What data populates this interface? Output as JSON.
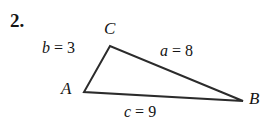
{
  "problem": {
    "number": "2."
  },
  "figure": {
    "type": "triangle-diagram",
    "background_color": "#ffffff",
    "stroke_color": "#2b2b2b",
    "stroke_width": 2,
    "vertices": [
      {
        "name": "C",
        "label": "C",
        "x": 110,
        "y": 46
      },
      {
        "name": "A",
        "label": "A",
        "x": 84,
        "y": 92
      },
      {
        "name": "B",
        "label": "B",
        "x": 243,
        "y": 101
      }
    ],
    "sides": [
      {
        "name": "b",
        "label": "b = 3",
        "var": "b",
        "eq": " = ",
        "value": "3",
        "between": [
          "A",
          "C"
        ]
      },
      {
        "name": "a",
        "label": "a = 8",
        "var": "a",
        "eq": " = ",
        "value": "8",
        "between": [
          "C",
          "B"
        ]
      },
      {
        "name": "c",
        "label": "c = 9",
        "var": "c",
        "eq": " = ",
        "value": "9",
        "between": [
          "A",
          "B"
        ]
      }
    ]
  }
}
